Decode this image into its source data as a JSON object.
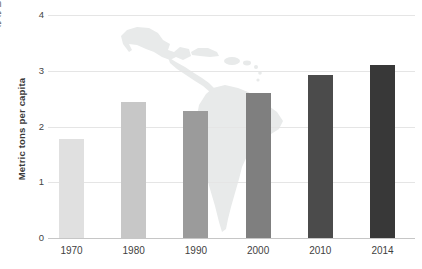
{
  "page": {
    "left_edge_fragments": [
      "n",
      "e",
      "e"
    ]
  },
  "chart_data": {
    "type": "bar",
    "title": "",
    "subtitle": "",
    "xlabel": "",
    "ylabel": "Metric tons per capita",
    "categories": [
      "1970",
      "1980",
      "1990",
      "2000",
      "2010",
      "2014"
    ],
    "values": [
      1.77,
      2.44,
      2.28,
      2.6,
      2.93,
      3.11
    ],
    "ylim": [
      0,
      4
    ],
    "yticks": [
      0,
      1,
      2,
      3,
      4
    ],
    "bar_colors": [
      "#e0e0e0",
      "#c7c7c7",
      "#9b9b9b",
      "#7f7f7f",
      "#4b4b4b",
      "#383838"
    ],
    "grid": true,
    "legend": "none",
    "background": "faint Latin America map silhouette behind bars"
  }
}
